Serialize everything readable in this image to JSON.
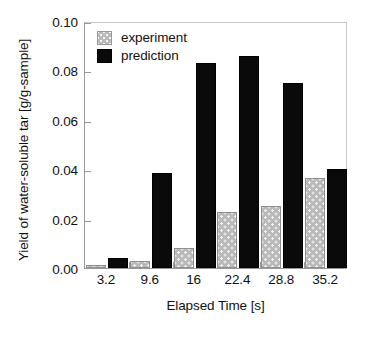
{
  "chart_data": {
    "type": "bar",
    "title": "",
    "xlabel": "Elapsed Time [s]",
    "ylabel": "Yield of water-soluble tar [g/g-sample]",
    "categories": [
      "3.2",
      "9.6",
      "16",
      "22.4",
      "28.8",
      "35.2"
    ],
    "series": [
      {
        "name": "experiment",
        "color": "#bdbdbd",
        "pattern": "dotted",
        "values": [
          0.0013,
          0.0027,
          0.008,
          0.0227,
          0.0253,
          0.0365
        ]
      },
      {
        "name": "prediction",
        "color": "#000000",
        "pattern": "solid",
        "values": [
          0.0041,
          0.0385,
          0.0832,
          0.0858,
          0.0751,
          0.04
        ]
      }
    ],
    "ylim": [
      0.0,
      0.1
    ],
    "yticks": [
      0.0,
      0.02,
      0.04,
      0.06,
      0.08,
      0.1
    ],
    "ytick_labels": [
      "0.00",
      "0.02",
      "0.04",
      "0.06",
      "0.08",
      "0.10"
    ],
    "grid": false,
    "legend_position": "top-left",
    "legend_entries": [
      "experiment",
      "prediction"
    ]
  }
}
